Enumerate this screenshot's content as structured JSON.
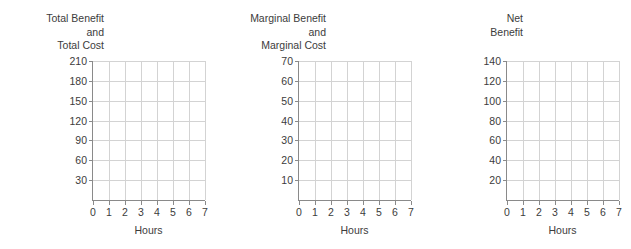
{
  "chart_data": [
    {
      "type": "line",
      "title": "Total Benefit and Total Cost",
      "title_lines": [
        "Total Benefit",
        "and",
        "Total Cost"
      ],
      "xlabel": "Hours",
      "ylabel": "Total Benefit and Total Cost",
      "x": [
        0,
        1,
        2,
        3,
        4,
        5,
        6,
        7
      ],
      "xticks": [
        "0",
        "1",
        "2",
        "3",
        "4",
        "5",
        "6",
        "7"
      ],
      "yticks": [
        "30",
        "60",
        "90",
        "120",
        "150",
        "180",
        "210"
      ],
      "ytick_values": [
        30,
        60,
        90,
        120,
        150,
        180,
        210
      ],
      "xlim": [
        0,
        7
      ],
      "ylim": [
        0,
        210
      ],
      "grid": true,
      "legend": "none",
      "series": []
    },
    {
      "type": "line",
      "title": "Marginal Benefit and Marginal Cost",
      "title_lines": [
        "Marginal Benefit",
        "and",
        "Marginal Cost"
      ],
      "xlabel": "Hours",
      "ylabel": "Marginal Benefit and Marginal Cost",
      "x": [
        0,
        1,
        2,
        3,
        4,
        5,
        6,
        7
      ],
      "xticks": [
        "0",
        "1",
        "2",
        "3",
        "4",
        "5",
        "6",
        "7"
      ],
      "yticks": [
        "10",
        "20",
        "30",
        "40",
        "50",
        "60",
        "70"
      ],
      "ytick_values": [
        10,
        20,
        30,
        40,
        50,
        60,
        70
      ],
      "xlim": [
        0,
        7
      ],
      "ylim": [
        0,
        70
      ],
      "grid": true,
      "legend": "none",
      "series": []
    },
    {
      "type": "line",
      "title": "Net Benefit",
      "title_lines": [
        "Net",
        "Benefit"
      ],
      "xlabel": "Hours",
      "ylabel": "Net Benefit",
      "x": [
        0,
        1,
        2,
        3,
        4,
        5,
        6,
        7
      ],
      "xticks": [
        "0",
        "1",
        "2",
        "3",
        "4",
        "5",
        "6",
        "7"
      ],
      "yticks": [
        "20",
        "40",
        "60",
        "80",
        "100",
        "120",
        "140"
      ],
      "ytick_values": [
        20,
        40,
        60,
        80,
        100,
        120,
        140
      ],
      "xlim": [
        0,
        7
      ],
      "ylim": [
        0,
        140
      ],
      "grid": true,
      "legend": "none",
      "series": []
    }
  ],
  "colors": {
    "background": "#ffffff",
    "axis": "#8a8a8a",
    "grid": "#d3d3d3",
    "text": "#3c3c3c"
  }
}
